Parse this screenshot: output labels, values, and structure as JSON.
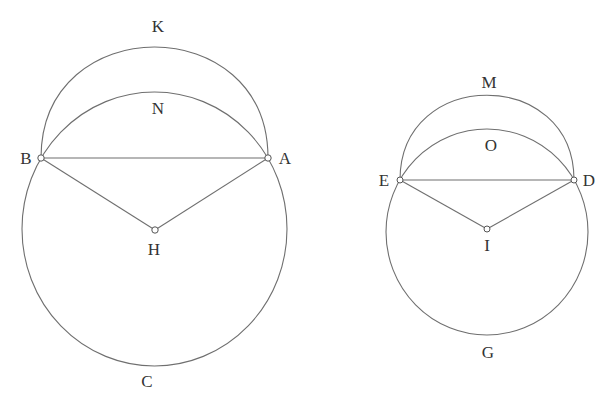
{
  "figures": [
    {
      "name": "left-figure",
      "circle_label": "ABC",
      "points": {
        "B": "B",
        "A": "A",
        "H": "H"
      },
      "arc_labels": {
        "outer_arc": "K",
        "inner_arc": "N",
        "bottom": "C"
      }
    },
    {
      "name": "right-figure",
      "circle_label": "DEG",
      "points": {
        "E": "E",
        "D": "D",
        "I": "I"
      },
      "arc_labels": {
        "outer_arc": "M",
        "inner_arc": "O",
        "bottom": "G"
      }
    }
  ],
  "colors": {
    "stroke": "#6f6f6f",
    "text": "#333333",
    "background": "#ffffff"
  }
}
